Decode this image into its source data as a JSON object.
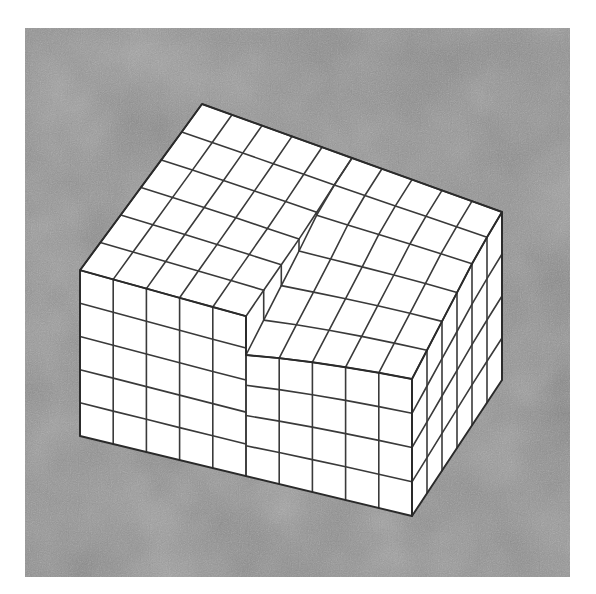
{
  "figure": {
    "background_color": "#8a8a8a",
    "mesh_fill": "#ffffff",
    "line_color": "#3a3a3a",
    "frame": {
      "x": 25,
      "y": 28,
      "width": 545,
      "height": 549
    }
  },
  "mesh": {
    "top_back_left": [
      202,
      104
    ],
    "top_back_right": [
      502,
      212
    ],
    "top_front_left": [
      80,
      272
    ],
    "top_front_right": [
      412,
      364
    ],
    "bottom_front_left": [
      80,
      436
    ],
    "bottom_front_right": [
      412,
      516
    ],
    "bottom_back_right": [
      502,
      380
    ],
    "columns_x": 10,
    "rows_depth": 6,
    "layers_left": 5,
    "layers_right": 4,
    "step_column": 5,
    "step_top": [
      245,
      311
    ],
    "step_bottom": [
      245,
      348
    ],
    "step_back_top": [
      296,
      214
    ],
    "step_back_bottom": [
      296,
      236
    ]
  }
}
